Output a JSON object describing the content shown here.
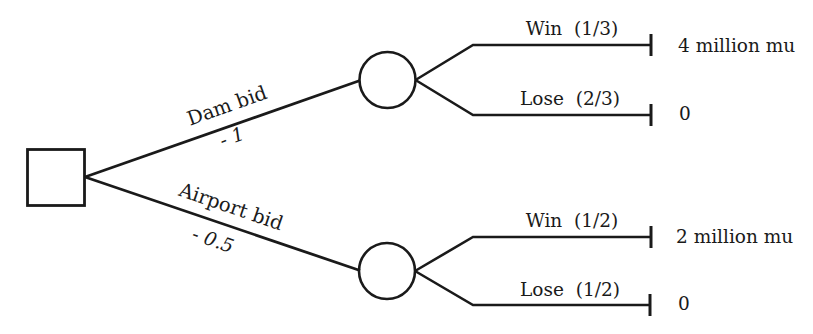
{
  "figure": {
    "type": "decision-tree",
    "background_color": "#ffffff",
    "line_color": "#1a1a1a",
    "decision_node_shape": "square",
    "chance_node_shape": "circle",
    "branches": [
      {
        "action_label": "Dam bid",
        "cost_label": "- 1",
        "outcomes": [
          {
            "outcome_label": "Win  (1/3)",
            "payoff": "4 million mu"
          },
          {
            "outcome_label": "Lose  (2/3)",
            "payoff": "0"
          }
        ]
      },
      {
        "action_label": "Airport bid",
        "cost_label": "- 0.5",
        "outcomes": [
          {
            "outcome_label": "Win  (1/2)",
            "payoff": "2 million mu"
          },
          {
            "outcome_label": "Lose  (1/2)",
            "payoff": "0"
          }
        ]
      }
    ]
  }
}
